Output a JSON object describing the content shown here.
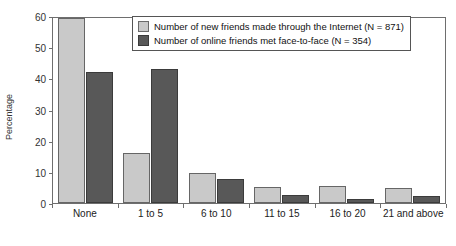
{
  "chart_data": {
    "type": "bar",
    "title": "",
    "xlabel": "",
    "ylabel": "Percentage",
    "ylim": [
      0,
      60
    ],
    "yticks": [
      0,
      10,
      20,
      30,
      40,
      50,
      60
    ],
    "grid": false,
    "legend_position": "top-center",
    "categories": [
      "None",
      "1 to 5",
      "6 to 10",
      "11 to 15",
      "16 to 20",
      "21 and above"
    ],
    "series": [
      {
        "name": "Number of new friends made through the Internet (N = 871)",
        "color": "#c9c9c9",
        "values": [
          59.5,
          16.0,
          9.6,
          5.0,
          5.3,
          4.9
        ]
      },
      {
        "name": "Number of online friends met face-to-face (N = 354)",
        "color": "#585858",
        "values": [
          42.0,
          43.0,
          7.7,
          2.5,
          1.4,
          2.2
        ]
      }
    ]
  }
}
